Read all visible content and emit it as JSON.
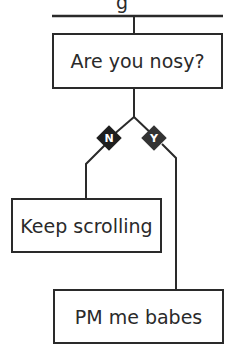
{
  "diagram": {
    "top_partial_text": "g",
    "question": "Are you nosy?",
    "branches": [
      {
        "label": "N",
        "result": "Keep scrolling"
      },
      {
        "label": "Y",
        "result": "PM me babes"
      }
    ],
    "colors": {
      "line": "#2a2a2a",
      "diamond_n": "#1e1e1e",
      "diamond_y": "#333333"
    }
  }
}
